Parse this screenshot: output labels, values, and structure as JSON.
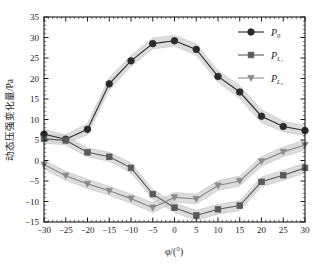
{
  "chart_data": {
    "type": "line",
    "title": "",
    "xlabel": "φ/(°)",
    "ylabel_cjk": "动态压强变化量",
    "ylabel_unit": "/Pa",
    "x": [
      -30,
      -25,
      -20,
      -15,
      -10,
      -5,
      0,
      5,
      10,
      15,
      20,
      25,
      30
    ],
    "xlim": [
      -30,
      30
    ],
    "ylim": [
      -15,
      35
    ],
    "xticks": [
      "-30",
      "-25",
      "-20",
      "-15",
      "-10",
      "-5",
      "0",
      "5",
      "10",
      "15",
      "20",
      "25",
      "30"
    ],
    "yticks": [
      "-15",
      "-10",
      "-5",
      "0",
      "5",
      "10",
      "15",
      "20",
      "25",
      "30",
      "35"
    ],
    "grid": false,
    "legend_position": "top-right",
    "series": [
      {
        "name": "P0",
        "label_base": "P",
        "label_sub": "0",
        "marker": "circle",
        "color": "#2b2b2b",
        "values": [
          6.4,
          5.2,
          7.6,
          18.7,
          24.3,
          28.5,
          29.2,
          27.1,
          20.5,
          16.7,
          10.8,
          8.3,
          7.3
        ],
        "band_upper": [
          7.6,
          6.3,
          9.0,
          20.2,
          25.6,
          29.9,
          30.5,
          28.5,
          21.9,
          18.3,
          12.4,
          9.6,
          8.5
        ],
        "band_lower": [
          5.2,
          4.1,
          6.3,
          17.2,
          23.0,
          27.2,
          27.9,
          25.7,
          19.1,
          15.1,
          9.2,
          7.0,
          6.1
        ]
      },
      {
        "name": "PL1",
        "label_base": "P",
        "label_sub": "L₁",
        "marker": "square",
        "color": "#5a5a5a",
        "values": [
          5.3,
          4.9,
          2.0,
          0.9,
          -1.8,
          -8.2,
          -11.5,
          -13.4,
          -11.9,
          -11.0,
          -5.2,
          -3.6,
          -1.8
        ],
        "band_upper": [
          6.4,
          6.0,
          3.1,
          2.0,
          -0.6,
          -7.0,
          -10.3,
          -12.2,
          -10.7,
          -9.8,
          -4.0,
          -2.4,
          -0.6
        ],
        "band_lower": [
          4.2,
          3.8,
          0.9,
          -0.2,
          -3.0,
          -9.4,
          -12.7,
          -14.6,
          -13.1,
          -12.2,
          -6.4,
          -4.8,
          -3.0
        ]
      },
      {
        "name": "PL2",
        "label_base": "P",
        "label_sub": "L₂",
        "marker": "triangle-down",
        "color": "#8a8a8a",
        "values": [
          -1.0,
          -3.7,
          -5.7,
          -7.4,
          -9.3,
          -11.5,
          -9.0,
          -9.4,
          -6.1,
          -5.0,
          -0.2,
          2.1,
          3.8
        ],
        "band_upper": [
          0.1,
          -2.6,
          -4.6,
          -6.3,
          -8.2,
          -10.3,
          -7.8,
          -8.2,
          -4.9,
          -3.8,
          1.0,
          3.3,
          5.0
        ],
        "band_lower": [
          -2.1,
          -4.8,
          -6.8,
          -8.5,
          -10.4,
          -12.7,
          -10.2,
          -10.6,
          -7.3,
          -6.2,
          -1.4,
          0.9,
          2.6
        ]
      }
    ]
  },
  "legend": {
    "entries": [
      {
        "text": "P",
        "sub": "0"
      },
      {
        "text": "P",
        "sub": "L1"
      },
      {
        "text": "P",
        "sub": "L2"
      }
    ]
  }
}
